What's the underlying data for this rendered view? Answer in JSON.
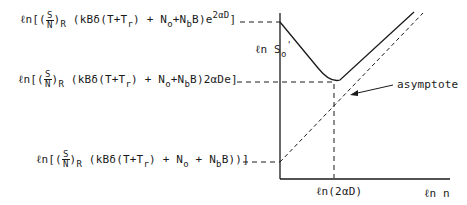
{
  "diagram": {
    "y_axis_label": {
      "prefix": "ℓn S",
      "sub": "o",
      "sup": "'"
    },
    "x_axis_label": "ℓn n",
    "x_tick_label": "ℓn(2αD)",
    "annotation": "asymptote",
    "labels": [
      {
        "pre": "ℓn[(",
        "frac_num": "S",
        "frac_den": "N",
        "post1": ")",
        "sub1": "R",
        "body": " (kBδ(T+T",
        "sub2": "r",
        "body2": ") + N",
        "sub3": "o",
        "body3": "+N",
        "sub4": "b",
        "body4": "B)e",
        "sup": "2αD",
        "end": "]"
      },
      {
        "pre": "ℓn[(",
        "frac_num": "S",
        "frac_den": "N",
        "post1": ")",
        "sub1": "R",
        "body": " (kBδ(T+T",
        "sub2": "r",
        "body2": ") + N",
        "sub3": "o",
        "body3": "+N",
        "sub4": "b",
        "body4": "B)2αDe",
        "sup": "",
        "end": "]"
      },
      {
        "pre": "ℓn[(",
        "frac_num": "S",
        "frac_den": "N",
        "post1": ")",
        "sub1": "R",
        "body": " (kBδ(T+T",
        "sub2": "r",
        "body2": ")  + N",
        "sub3": "o",
        "body3": " + N",
        "sub4": "b",
        "body4": "B))",
        "sup": "",
        "end": "]"
      }
    ]
  }
}
